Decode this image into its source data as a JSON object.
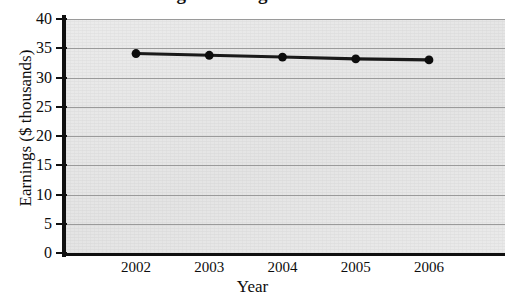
{
  "chart_data": {
    "type": "line",
    "title": "Average Earnings for Females",
    "title_note": "title is cropped off the top edge of the screenshot",
    "xlabel": "Year",
    "ylabel": "Earnings ($ thousands)",
    "categories": [
      "2002",
      "2003",
      "2004",
      "2005",
      "2006"
    ],
    "values": [
      34.1,
      33.8,
      33.5,
      33.2,
      33.0
    ],
    "series": [
      {
        "name": "Average earnings",
        "values": [
          34.1,
          33.8,
          33.5,
          33.2,
          33.0
        ]
      }
    ],
    "ylim": [
      0,
      40
    ],
    "yticks": [
      0,
      5,
      10,
      15,
      20,
      25,
      30,
      35,
      40
    ],
    "ytick_labels": [
      "0",
      "5",
      "10",
      "15",
      "20",
      "25",
      "30",
      "35",
      "40"
    ],
    "xtick_labels": [
      "2002",
      "2003",
      "2004",
      "2005",
      "2006"
    ],
    "grid": "horizontal",
    "legend": "none",
    "marker": "filled-circle",
    "colors": {
      "line": "#1a1a1a",
      "marker": "#0d0d0d",
      "plot_background": "#e7e7e7",
      "gridline": "#9a9a9a",
      "axis": "#101010",
      "text": "#0d0d0d",
      "page_background": "#ffffff"
    }
  }
}
